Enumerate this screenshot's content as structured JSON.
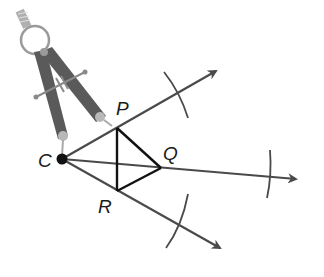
{
  "diagram": {
    "colors": {
      "background": "#ffffff",
      "ray": "#4a4a4a",
      "segment": "#111111",
      "arc": "#4a4a4a",
      "point": "#111111",
      "compass_leg": "#5a5a5a",
      "compass_ring": "#9a9a9a",
      "compass_knob": "#b8b8b8"
    },
    "points": {
      "C": {
        "label": "C",
        "x": 62,
        "y": 159
      },
      "P": {
        "label": "P",
        "x": 117,
        "y": 128
      },
      "Q": {
        "label": "Q",
        "x": 161,
        "y": 168
      },
      "R": {
        "label": "R",
        "x": 117,
        "y": 191
      }
    },
    "rays": [
      {
        "name": "ray-CP",
        "from": "C",
        "to": [
          224,
          67
        ]
      },
      {
        "name": "ray-CQ",
        "from": "C",
        "to": [
          304,
          180
        ]
      },
      {
        "name": "ray-CR",
        "from": "C",
        "to": [
          228,
          253
        ]
      }
    ],
    "segments": [
      {
        "name": "segment-PR",
        "from": "P",
        "to": "R"
      },
      {
        "name": "segment-PQ",
        "from": "P",
        "to": "Q"
      },
      {
        "name": "segment-RQ",
        "from": "R",
        "to": "Q"
      }
    ],
    "arcs": [
      {
        "name": "arc-upper",
        "start": [
          164,
          72
        ],
        "end": [
          188,
          118
        ]
      },
      {
        "name": "arc-right",
        "start": [
          270,
          150
        ],
        "end": [
          267,
          198
        ]
      },
      {
        "name": "arc-lower",
        "start": [
          188,
          194
        ],
        "end": [
          166,
          248
        ]
      }
    ],
    "labels": {
      "C": "C",
      "P": "P",
      "Q": "Q",
      "R": "R"
    },
    "compass": {
      "description": "drawing compass with pivot ring, needle leg on C and pencil leg on P"
    }
  }
}
